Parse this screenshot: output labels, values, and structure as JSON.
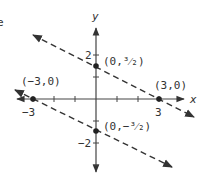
{
  "diagram": {
    "type": "coordinate-plane",
    "axes": {
      "x_label": "x",
      "y_label": "y"
    },
    "tick_labels": {
      "x_neg": "-3",
      "x_pos": "3",
      "y_pos": "2",
      "y_neg": "-2"
    },
    "points": [
      {
        "label": "(0,³⁄₂)",
        "text": "(0,3/2)"
      },
      {
        "label": "(3,0)",
        "text": "(3,0)"
      },
      {
        "label": "(-3,0)",
        "text": "(-3,0)"
      },
      {
        "label": "(0,-³⁄₂)",
        "text": "(0,-3/2)"
      }
    ],
    "lines": [
      {
        "name": "upper-line",
        "style": "dashed",
        "through": [
          "(0,3/2)",
          "(3,0)"
        ]
      },
      {
        "name": "lower-line",
        "style": "dashed",
        "through": [
          "(-3,0)",
          "(0,-3/2)"
        ]
      }
    ],
    "edge_fragment": "e"
  },
  "labels": {
    "y_axis": "y",
    "x_axis": "x",
    "tick_2": "2",
    "tick_neg2": "−2",
    "tick_3": "3",
    "tick_neg3": "−3",
    "pt_upper_y": "(0,³⁄₂)",
    "pt_x_pos": "(3,0)",
    "pt_x_neg": "(−3,0)",
    "pt_lower_y": "(0,−³⁄₂)",
    "fragment": "e"
  }
}
